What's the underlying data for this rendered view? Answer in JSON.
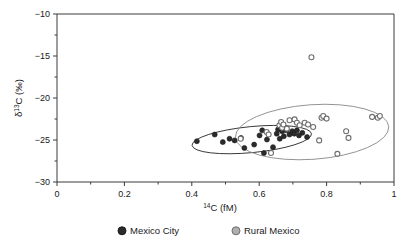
{
  "chart_data": {
    "type": "scatter",
    "title": "",
    "xlabel": "14C (fM)",
    "xlabel_parts": {
      "sup": "14",
      "rest": "C (fM)"
    },
    "ylabel": "d13C (‰)",
    "ylabel_parts": {
      "pre": "δ",
      "sup": "13",
      "rest": "C (‰)"
    },
    "xlim": [
      0,
      1
    ],
    "ylim": [
      -30,
      -10
    ],
    "xticks": [
      0,
      0.2,
      0.4,
      0.6,
      0.8,
      1
    ],
    "xtick_labels": [
      "0",
      "0.2",
      "0.4",
      "0.6",
      "0.8",
      "1"
    ],
    "xminor_ticks": [
      0.1,
      0.3,
      0.5,
      0.7,
      0.9
    ],
    "yticks": [
      -10,
      -15,
      -20,
      -25,
      -30
    ],
    "ytick_labels": [
      "−10",
      "−15",
      "−20",
      "−25",
      "−30"
    ],
    "yminor_ticks": [
      -12.5,
      -17.5,
      -22.5,
      -27.5
    ],
    "grid": false,
    "legend_position": "below-axis",
    "series": [
      {
        "name": "Mexico City",
        "marker": "filled-circle",
        "color": "#2b2b2b",
        "edge_color": "#1a1a1a",
        "points": [
          [
            0.415,
            -25.15
          ],
          [
            0.468,
            -24.35
          ],
          [
            0.492,
            -25.25
          ],
          [
            0.512,
            -24.85
          ],
          [
            0.527,
            -25.05
          ],
          [
            0.546,
            -24.75
          ],
          [
            0.556,
            -25.95
          ],
          [
            0.585,
            -25.55
          ],
          [
            0.601,
            -24.45
          ],
          [
            0.609,
            -23.85
          ],
          [
            0.614,
            -26.55
          ],
          [
            0.623,
            -24.95
          ],
          [
            0.641,
            -25.85
          ],
          [
            0.652,
            -24.25
          ],
          [
            0.656,
            -23.75
          ],
          [
            0.661,
            -24.85
          ],
          [
            0.668,
            -23.95
          ],
          [
            0.673,
            -24.55
          ],
          [
            0.681,
            -23.85
          ],
          [
            0.69,
            -24.35
          ],
          [
            0.698,
            -23.95
          ],
          [
            0.704,
            -24.25
          ],
          [
            0.712,
            -23.85
          ],
          [
            0.718,
            -24.45
          ],
          [
            0.728,
            -24.15
          ],
          [
            0.742,
            -24.65
          ]
        ]
      },
      {
        "name": "Rural Mexico",
        "marker": "open-circle",
        "color": "#8a8a8a",
        "edge_color": "#6e6e6e",
        "points": [
          [
            0.545,
            -24.85
          ],
          [
            0.622,
            -24.05
          ],
          [
            0.628,
            -24.35
          ],
          [
            0.635,
            -26.55
          ],
          [
            0.66,
            -23.25
          ],
          [
            0.665,
            -22.85
          ],
          [
            0.668,
            -23.55
          ],
          [
            0.672,
            -23.15
          ],
          [
            0.682,
            -23.65
          ],
          [
            0.69,
            -22.65
          ],
          [
            0.705,
            -22.55
          ],
          [
            0.712,
            -22.95
          ],
          [
            0.72,
            -23.25
          ],
          [
            0.735,
            -22.95
          ],
          [
            0.745,
            -23.15
          ],
          [
            0.755,
            -15.15
          ],
          [
            0.76,
            -23.45
          ],
          [
            0.778,
            -25.05
          ],
          [
            0.785,
            -22.35
          ],
          [
            0.79,
            -22.15
          ],
          [
            0.8,
            -22.45
          ],
          [
            0.832,
            -26.65
          ],
          [
            0.858,
            -23.95
          ],
          [
            0.865,
            -24.75
          ],
          [
            0.935,
            -22.25
          ],
          [
            0.952,
            -22.35
          ],
          [
            0.958,
            -22.15
          ]
        ]
      }
    ],
    "ellipses": [
      {
        "name": "Mexico City confidence ellipse",
        "color": "#2b2b2b",
        "cx": 0.578,
        "cy": -24.95,
        "rx": 0.178,
        "ry": 1.55,
        "rotation_deg": -5.5
      },
      {
        "name": "Rural Mexico confidence ellipse",
        "color": "#8a8a8a",
        "cx": 0.757,
        "cy": -24.05,
        "rx": 0.228,
        "ry": 3.25,
        "rotation_deg": -4.0
      }
    ],
    "legend": [
      {
        "label": "Mexico City",
        "marker": "filled-circle",
        "color": "#2b2b2b"
      },
      {
        "label": "Rural Mexico",
        "marker": "open-circle",
        "color": "#8a8a8a"
      }
    ]
  },
  "colors": {
    "axis": "#3a3a3a",
    "mexico_city": "#2b2b2b",
    "rural_mexico": "#8a8a8a",
    "background": "#ffffff"
  }
}
